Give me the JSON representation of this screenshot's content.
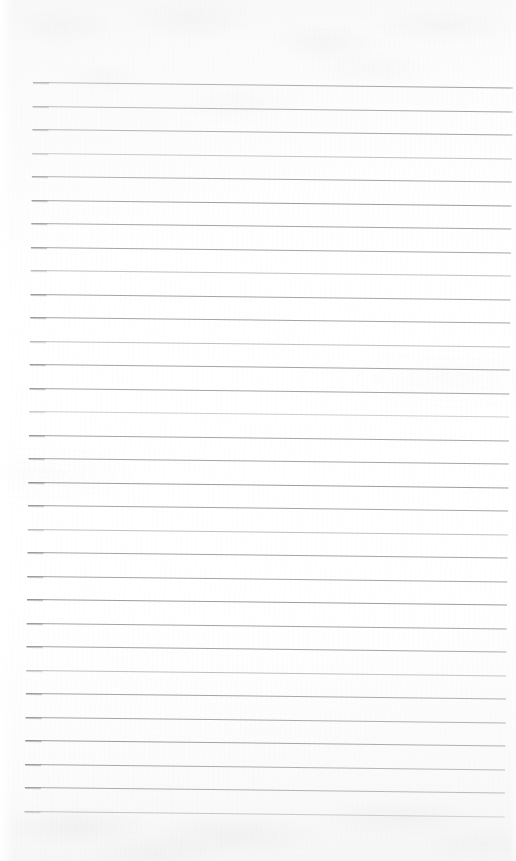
{
  "document": {
    "kind": "scanned-lined-paper",
    "title": "Blank Ruled Notebook Page",
    "content_text": "",
    "page_width": 516,
    "page_height": 861,
    "is_blank": "true",
    "handwriting_present": "false"
  },
  "paper": {
    "background_color": "#fdfdfd",
    "base_tint_top": "#fafafa",
    "base_tint_bottom": "#f7f7f7",
    "texture": "mottled-scan-grain",
    "edge_highlight_color": "#ffffff"
  },
  "ruling": {
    "line_color": "#9d9da2",
    "line_thickness_px": 1,
    "line_count": 32,
    "first_line_y": 82,
    "last_line_y": 810,
    "line_spacing_px": 23.5,
    "line_start_x": 33,
    "line_end_x": 513,
    "skew_degrees": 0.66,
    "top_margin_px": 82,
    "bottom_margin_px": 51,
    "lines": [
      {
        "index": 1,
        "y": 82,
        "weight": "strong"
      },
      {
        "index": 2,
        "y": 105.5,
        "weight": "normal"
      },
      {
        "index": 3,
        "y": 129,
        "weight": "normal"
      },
      {
        "index": 4,
        "y": 152.5,
        "weight": "faint"
      },
      {
        "index": 5,
        "y": 176,
        "weight": "normal"
      },
      {
        "index": 6,
        "y": 199.5,
        "weight": "strong"
      },
      {
        "index": 7,
        "y": 223,
        "weight": "normal"
      },
      {
        "index": 8,
        "y": 246.5,
        "weight": "normal"
      },
      {
        "index": 9,
        "y": 270,
        "weight": "faint"
      },
      {
        "index": 10,
        "y": 293.5,
        "weight": "normal"
      },
      {
        "index": 11,
        "y": 317,
        "weight": "normal"
      },
      {
        "index": 12,
        "y": 340.5,
        "weight": "faint"
      },
      {
        "index": 13,
        "y": 364,
        "weight": "normal"
      },
      {
        "index": 14,
        "y": 387.5,
        "weight": "normal"
      },
      {
        "index": 15,
        "y": 411,
        "weight": "faintest"
      },
      {
        "index": 16,
        "y": 434.5,
        "weight": "normal"
      },
      {
        "index": 17,
        "y": 458,
        "weight": "normal"
      },
      {
        "index": 18,
        "y": 481.5,
        "weight": "strong"
      },
      {
        "index": 19,
        "y": 505,
        "weight": "normal"
      },
      {
        "index": 20,
        "y": 528.5,
        "weight": "faint"
      },
      {
        "index": 21,
        "y": 552,
        "weight": "normal"
      },
      {
        "index": 22,
        "y": 575.5,
        "weight": "normal"
      },
      {
        "index": 23,
        "y": 599,
        "weight": "strong"
      },
      {
        "index": 24,
        "y": 622.5,
        "weight": "normal"
      },
      {
        "index": 25,
        "y": 646,
        "weight": "normal"
      },
      {
        "index": 26,
        "y": 669.5,
        "weight": "faint"
      },
      {
        "index": 27,
        "y": 693,
        "weight": "normal"
      },
      {
        "index": 28,
        "y": 716.5,
        "weight": "normal"
      },
      {
        "index": 29,
        "y": 740,
        "weight": "strong"
      },
      {
        "index": 30,
        "y": 763.5,
        "weight": "normal"
      },
      {
        "index": 31,
        "y": 787,
        "weight": "normal"
      },
      {
        "index": 32,
        "y": 810.5,
        "weight": "faint"
      }
    ]
  }
}
